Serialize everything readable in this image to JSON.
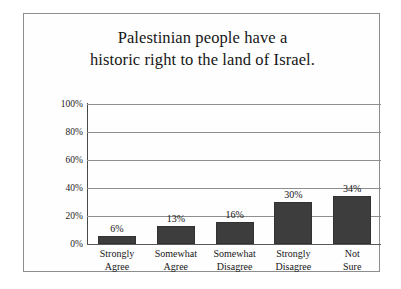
{
  "chart_data": {
    "type": "bar",
    "title": "Palestinian people have a\nhistoric right to the land of Israel.",
    "xlabel": "",
    "ylabel": "",
    "categories": [
      "Strongly\nAgree",
      "Somewhat\nAgree",
      "Somewhat\nDisagree",
      "Strongly\nDisagree",
      "Not\nSure"
    ],
    "values": [
      6,
      13,
      16,
      30,
      34
    ],
    "value_labels": [
      "6%",
      "13%",
      "16%",
      "30%",
      "34%"
    ],
    "ylim": [
      0,
      100
    ],
    "ytick_labels": [
      "100%",
      "80%",
      "60%",
      "40%",
      "20%",
      "0%"
    ],
    "ytick_values": [
      100,
      80,
      60,
      40,
      20,
      0
    ],
    "grid": true,
    "legend": false,
    "colors": {
      "bar_fill": "#3d3d3d",
      "bar_stroke": "#323232",
      "gridline": "#8e8e8e",
      "axis": "#4a4a4a",
      "frame": "#8d8d8d",
      "background": "#fefefe",
      "text": "#161616"
    }
  }
}
